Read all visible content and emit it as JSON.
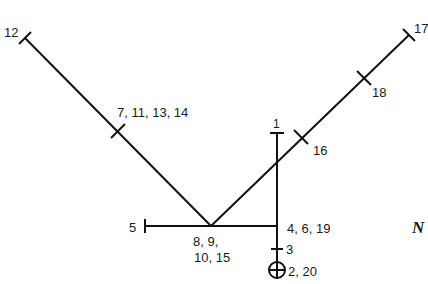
{
  "diagram": {
    "type": "stick-path-diagram",
    "stroke_color": "#111111",
    "background": "#ffffff",
    "labels": {
      "end_upper_left": "12",
      "tick_left_arm": "7, 11, 13, 14",
      "end_upper_right": "17",
      "tick_right_arm_upper": "18",
      "tick_right_arm_lower": "16",
      "top_of_vertical": "1",
      "left_horizontal_end": "5",
      "vertex_line1": "8, 9,",
      "vertex_line2": "10, 15",
      "junction": "4, 6, 19",
      "tick_lower": "3",
      "start_marker": "2, 20",
      "compass_partial": "N"
    },
    "markers": {
      "start_symbol": "circle-cross"
    }
  }
}
